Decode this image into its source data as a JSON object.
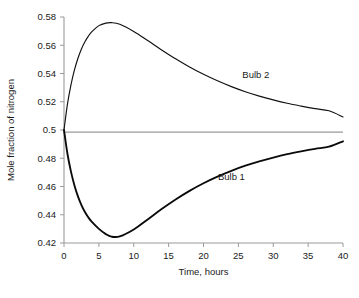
{
  "chart_data": {
    "type": "line",
    "title": "",
    "xlabel": "Time, hours",
    "ylabel": "Mole fraction of nitrogen",
    "xlim": [
      0,
      40
    ],
    "ylim": [
      0.42,
      0.58
    ],
    "xticks": [
      0,
      5,
      10,
      15,
      20,
      25,
      30,
      35,
      40
    ],
    "xtick_labels": [
      "0",
      "5",
      "10",
      "15",
      "20",
      "25",
      "30",
      "35",
      "40"
    ],
    "yticks": [
      0.42,
      0.44,
      0.46,
      0.48,
      0.5,
      0.52,
      0.54,
      0.56,
      0.58
    ],
    "ytick_labels": [
      "0.42",
      "0.44",
      "0.46",
      "0.48",
      "0.5",
      "0.52",
      "0.54",
      "0.56",
      "0.58"
    ],
    "grid": false,
    "legend": "inline-annotations",
    "reference_line": {
      "name": "equilibrium",
      "y": 0.4985,
      "color": "#9a9a9a"
    },
    "x": [
      0,
      0.5,
      1,
      1.5,
      2,
      2.5,
      3,
      3.5,
      4,
      5,
      6,
      6.8,
      8,
      10,
      12,
      14,
      16,
      18,
      20,
      22,
      24,
      26,
      28,
      30,
      32,
      34,
      36,
      38,
      40
    ],
    "series": [
      {
        "name": "Bulb 2",
        "label": "Bulb 2",
        "color": "#111111",
        "width": "thin",
        "values": [
          0.5,
          0.5185,
          0.532,
          0.5425,
          0.5508,
          0.5574,
          0.5625,
          0.5665,
          0.5696,
          0.5739,
          0.5757,
          0.576,
          0.5748,
          0.5697,
          0.5633,
          0.5567,
          0.5504,
          0.5446,
          0.5394,
          0.5348,
          0.5307,
          0.5271,
          0.524,
          0.5213,
          0.5189,
          0.5169,
          0.5151,
          0.5136,
          0.5092
        ]
      },
      {
        "name": "Bulb 1",
        "label": "Bulb 1",
        "color": "#0a0a0a",
        "width": "thick",
        "values": [
          0.5,
          0.483,
          0.4705,
          0.4607,
          0.453,
          0.4468,
          0.4419,
          0.438,
          0.4349,
          0.43,
          0.4263,
          0.4245,
          0.4247,
          0.4296,
          0.4367,
          0.444,
          0.4508,
          0.4569,
          0.4623,
          0.467,
          0.4711,
          0.4747,
          0.4778,
          0.4805,
          0.4829,
          0.4849,
          0.4867,
          0.4882,
          0.492
        ]
      }
    ],
    "annotations": [
      {
        "text": "Bulb 2",
        "x": 27.5,
        "y": 0.5365
      },
      {
        "text": "Bulb 1",
        "x": 24.0,
        "y": 0.4648
      }
    ]
  }
}
